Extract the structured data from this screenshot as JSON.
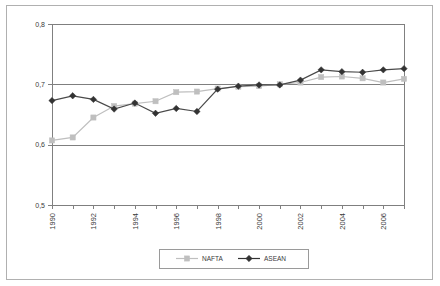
{
  "chart_data": {
    "type": "line",
    "title": "",
    "subtitle": "",
    "xlabel": "",
    "ylabel": "",
    "xlim": [
      1990,
      2007
    ],
    "ylim": [
      0.5,
      0.8
    ],
    "ytick_labels": [
      "0,8",
      "0,7",
      "0,6",
      "0,5"
    ],
    "ytick_values": [
      0.8,
      0.7,
      0.6,
      0.5
    ],
    "xtick_labels": [
      "1990",
      "1992",
      "1994",
      "1996",
      "1998",
      "2000",
      "2002",
      "2004",
      "2006"
    ],
    "xtick_values": [
      1990,
      1992,
      1994,
      1996,
      1998,
      2000,
      2002,
      2004,
      2006
    ],
    "x": [
      1990,
      1991,
      1992,
      1993,
      1994,
      1995,
      1996,
      1997,
      1998,
      1999,
      2000,
      2001,
      2002,
      2003,
      2004,
      2005,
      2006,
      2007
    ],
    "grid": true,
    "grid_axis": "y",
    "legend_position": "bottom",
    "series": [
      {
        "name": "NAFTA",
        "color": "#bfbfbf",
        "marker": "square",
        "values": [
          0.607,
          0.612,
          0.645,
          0.664,
          0.668,
          0.672,
          0.687,
          0.688,
          0.693,
          0.696,
          0.697,
          0.7,
          0.703,
          0.712,
          0.713,
          0.71,
          0.703,
          0.709
        ]
      },
      {
        "name": "ASEAN",
        "color": "#333333",
        "marker": "diamond",
        "values": [
          0.673,
          0.681,
          0.675,
          0.659,
          0.669,
          0.652,
          0.66,
          0.655,
          0.692,
          0.697,
          0.699,
          0.699,
          0.707,
          0.724,
          0.721,
          0.72,
          0.724,
          0.726
        ]
      }
    ]
  },
  "legend": {
    "entries": [
      {
        "label": "NAFTA"
      },
      {
        "label": "ASEAN"
      }
    ]
  }
}
